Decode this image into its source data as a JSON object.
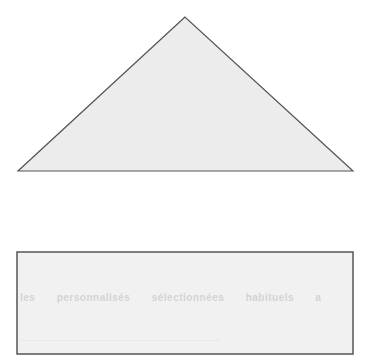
{
  "diagram": {
    "triangle": {
      "points": "185,17 18,171 353,171",
      "fill": "#ececec",
      "stroke": "#555555"
    },
    "rectangle": {
      "x": 17,
      "y": 252,
      "width": 336,
      "height": 102,
      "fill": "#f1f1f1",
      "stroke": "#555555"
    },
    "show_through_text": [
      "les personnalisés sélectionnées habituels a",
      "................................................................................"
    ]
  }
}
